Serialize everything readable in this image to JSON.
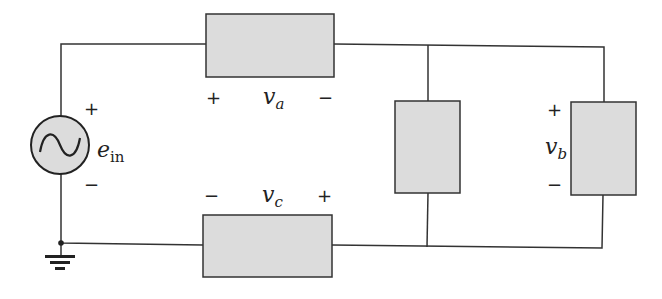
{
  "diagram": {
    "type": "circuit",
    "source": {
      "symbol": "e",
      "subscript": "in",
      "plus": "+",
      "minus": "−"
    },
    "elements": [
      {
        "id": "a",
        "symbol": "v",
        "subscript": "a",
        "left_sign": "+",
        "right_sign": "−"
      },
      {
        "id": "b",
        "symbol": "v",
        "subscript": "b",
        "top_sign": "+",
        "bottom_sign": "−"
      },
      {
        "id": "c",
        "symbol": "v",
        "subscript": "c",
        "left_sign": "−",
        "right_sign": "+"
      }
    ],
    "colors": {
      "wire": "#333333",
      "element_fill": "#dcdcdc",
      "element_stroke": "#333333",
      "source_fill": "#dcdcdc"
    }
  }
}
